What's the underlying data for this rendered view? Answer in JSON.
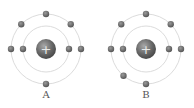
{
  "atoms": [
    {
      "label": "A",
      "nucleus_symbol": "+",
      "shells": [
        {
          "electron_angles_deg": [
            180,
            0
          ]
        },
        {
          "electron_angles_deg": [
            270,
            225,
            315,
            180,
            0,
            90
          ]
        }
      ]
    },
    {
      "label": "B",
      "nucleus_symbol": "+",
      "shells": [
        {
          "electron_angles_deg": [
            180,
            0
          ]
        },
        {
          "electron_angles_deg": [
            270,
            225,
            315,
            180,
            0,
            90,
            130
          ]
        }
      ]
    }
  ],
  "colors": {
    "orbit": "#dcdcdc",
    "electron": "#6e6e6e",
    "nucleus": "#6a6a6a",
    "label": "#555555"
  }
}
